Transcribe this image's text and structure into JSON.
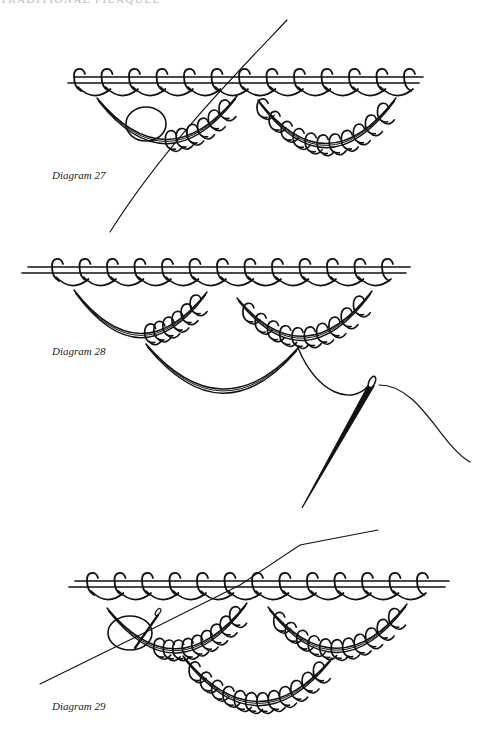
{
  "page": {
    "running_header": "TRADITIONAL FILAQUEE",
    "background": "#ffffff",
    "ink_color": "#111111"
  },
  "diagrams": [
    {
      "id": "diagram-27",
      "label": "Diagram 27",
      "label_pos": [
        52,
        169
      ],
      "bar": {
        "x1": 68,
        "x2": 423,
        "y": 77,
        "gap": 6
      },
      "top_loops": {
        "start_x": 80,
        "count": 13,
        "spacing": 27.5
      },
      "arcs": [
        {
          "x1": 97,
          "y1": 98,
          "x2": 237,
          "y2": 96,
          "depth": 42,
          "loops": 6,
          "loops_from": 0.5
        },
        {
          "x1": 258,
          "y1": 100,
          "x2": 396,
          "y2": 98,
          "depth": 44,
          "loops": 11,
          "loops_from": 0.0
        }
      ],
      "needle": {
        "thread": [
          [
            287,
            20
          ],
          [
            232,
            78
          ],
          [
            163,
            148
          ],
          [
            110,
            232
          ]
        ],
        "eye_ring": [
          146,
          124,
          20,
          17
        ]
      }
    },
    {
      "id": "diagram-28",
      "label": "Diagram 28",
      "label_pos": [
        52,
        345
      ],
      "bar": {
        "x1": 22,
        "x2": 410,
        "y": 267,
        "gap": 6
      },
      "top_loops": {
        "start_x": 58,
        "count": 13,
        "spacing": 27.5
      },
      "arcs": [
        {
          "x1": 74,
          "y1": 290,
          "x2": 207,
          "y2": 292,
          "depth": 42,
          "loops": 6,
          "loops_from": 0.55
        },
        {
          "x1": 237,
          "y1": 298,
          "x2": 372,
          "y2": 291,
          "depth": 40,
          "loops": 10,
          "loops_from": 0.05
        },
        {
          "x1": 146,
          "y1": 344,
          "x2": 298,
          "y2": 348,
          "depth": 42,
          "loops": 0,
          "loops_from": 0.0
        }
      ],
      "needle": {
        "eye": [
          372,
          382
        ],
        "point": [
          302,
          508
        ],
        "thread_in": [
          [
            298,
            348
          ],
          [
            318,
            395
          ],
          [
            352,
            405
          ],
          [
            368,
            386
          ]
        ],
        "thread_out": [
          [
            379,
            385
          ],
          [
            420,
            385
          ],
          [
            440,
            445
          ],
          [
            470,
            462
          ]
        ]
      }
    },
    {
      "id": "diagram-29",
      "label": "Diagram 29",
      "label_pos": [
        52,
        700
      ],
      "bar": {
        "x1": 69,
        "x2": 449,
        "y": 581,
        "gap": 6
      },
      "top_loops": {
        "start_x": 93,
        "count": 13,
        "spacing": 27.5
      },
      "arcs": [
        {
          "x1": 107,
          "y1": 608,
          "x2": 247,
          "y2": 603,
          "depth": 42,
          "loops": 9,
          "loops_from": 0.35
        },
        {
          "x1": 268,
          "y1": 607,
          "x2": 407,
          "y2": 604,
          "depth": 42,
          "loops": 11,
          "loops_from": 0.05
        },
        {
          "x1": 183,
          "y1": 656,
          "x2": 332,
          "y2": 658,
          "depth": 44,
          "loops": 12,
          "loops_from": 0.05
        }
      ],
      "needle": {
        "thread": [
          [
            378,
            530
          ],
          [
            300,
            545
          ],
          [
            240,
            585
          ],
          [
            150,
            630
          ],
          [
            40,
            684
          ]
        ],
        "eye_ring": [
          130,
          633,
          22,
          17
        ],
        "needle_seg": [
          [
            135,
            648
          ],
          [
            158,
            615
          ]
        ]
      }
    }
  ]
}
